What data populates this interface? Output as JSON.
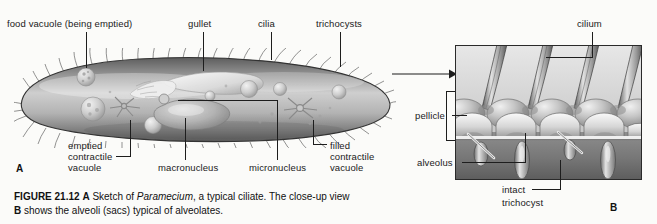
{
  "figure": {
    "caption_bold_prefix": "FIGURE 21.12",
    "caption_marker_a": "A",
    "caption_line1_rest_pre": " Sketch of ",
    "caption_italic_species": "Paramecium",
    "caption_line1_rest_post": ", a typical ciliate. The close-up view",
    "caption_marker_b": "B",
    "caption_line2": " shows the alveoli (sacs) typical of alveolates."
  },
  "panel_a": {
    "marker": "A",
    "labels": {
      "food_vacuole": "food vacuole (being emptied)",
      "gullet": "gullet",
      "cilia": "cilia",
      "trichocysts": "trichocysts",
      "emptied_contractile_vacuole_l1": "emptied",
      "emptied_contractile_vacuole_l2": "contractile",
      "emptied_contractile_vacuole_l3": "vacuole",
      "macronucleus": "macronucleus",
      "micronucleus": "micronucleus",
      "filled_contractile_vacuole_l1": "filled",
      "filled_contractile_vacuole_l2": "contractile",
      "filled_contractile_vacuole_l3": "vacuole"
    }
  },
  "panel_b": {
    "marker": "B",
    "labels": {
      "cilium": "cilium",
      "pellicle": "pellicle",
      "alveolus": "alveolus",
      "intact_trichocyst_l1": "intact",
      "intact_trichocyst_l2": "trichocyst"
    }
  },
  "colors": {
    "background": "#fbfbf9",
    "ink": "#1a1a1a",
    "cell_light": "#e9e9e9",
    "cell_mid": "#b7b7b7",
    "cell_dark": "#6f6f6f",
    "cell_edge": "#3a3a3a",
    "inset_light": "#dcdcdc",
    "inset_mid": "#a9a9a9",
    "inset_dark": "#5c5c5c",
    "inset_floor": "#7e7e7e"
  }
}
